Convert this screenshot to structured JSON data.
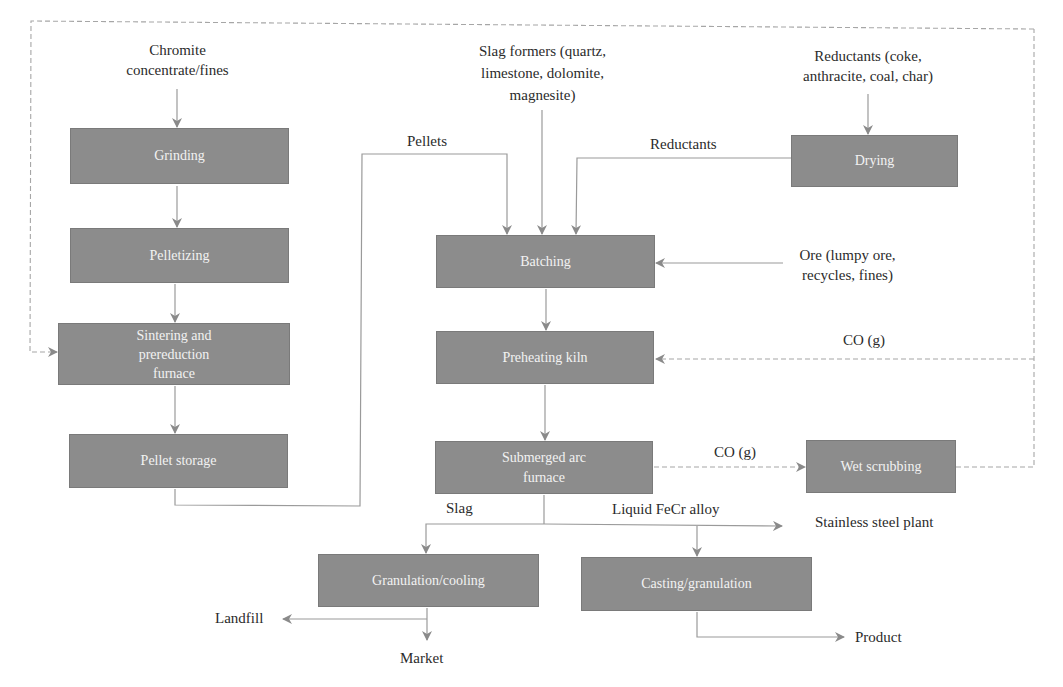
{
  "diagram": {
    "type": "process-flow",
    "colors": {
      "box_fill": "#8c8c8c",
      "box_text": "#f2f2f2",
      "line": "#8a8a8a",
      "label_text": "#2b2b2b"
    },
    "nodes": {
      "grinding": "Grinding",
      "pelletizing": "Pelletizing",
      "sintering_l1": "Sintering and",
      "sintering_l2": "prereduction",
      "sintering_l3": "furnace",
      "pellet_storage": "Pellet storage",
      "batching": "Batching",
      "preheating_kiln": "Preheating kiln",
      "saf_l1": "Submerged arc",
      "saf_l2": "furnace",
      "drying": "Drying",
      "wet_scrubbing": "Wet scrubbing",
      "granulation_cooling": "Granulation/cooling",
      "casting_granulation": "Casting/granulation"
    },
    "labels": {
      "chromite_l1": "Chromite",
      "chromite_l2": "concentrate/fines",
      "slag_formers_l1": "Slag formers (quartz,",
      "slag_formers_l2": "limestone, dolomite,",
      "slag_formers_l3": "magnesite)",
      "reductants_src_l1": "Reductants (coke,",
      "reductants_src_l2": "anthracite, coal, char)",
      "pellets": "Pellets",
      "reductants": "Reductants",
      "ore_l1": "Ore (lumpy ore,",
      "ore_l2": "recycles, fines)",
      "co_g_kiln": "CO (g)",
      "co_g_saf": "CO (g)",
      "slag": "Slag",
      "liquid_fecr": "Liquid FeCr alloy",
      "stainless_plant": "Stainless steel plant",
      "landfill": "Landfill",
      "market": "Market",
      "product": "Product"
    }
  }
}
